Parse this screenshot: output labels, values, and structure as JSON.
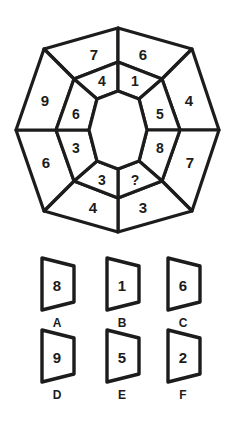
{
  "puzzle": {
    "type": "octagon-ring-number-puzzle",
    "missing_marker": "?",
    "center": {
      "fill": "#ffffff"
    },
    "stroke_color": "#1c1c1c",
    "outer_ring": {
      "label": "outer-ring",
      "count": 8,
      "cells": [
        {
          "pos": "top-left",
          "value": "7"
        },
        {
          "pos": "top-right",
          "value": "6"
        },
        {
          "pos": "right-upper",
          "value": "4"
        },
        {
          "pos": "right-lower",
          "value": "7"
        },
        {
          "pos": "bottom-right",
          "value": "3"
        },
        {
          "pos": "bottom-left",
          "value": "4"
        },
        {
          "pos": "left-lower",
          "value": "6"
        },
        {
          "pos": "left-upper",
          "value": "9"
        }
      ]
    },
    "inner_ring": {
      "label": "inner-ring",
      "count": 8,
      "cells": [
        {
          "pos": "top-left",
          "value": "4"
        },
        {
          "pos": "top-right",
          "value": "1"
        },
        {
          "pos": "right-upper",
          "value": "5"
        },
        {
          "pos": "right-lower",
          "value": "8"
        },
        {
          "pos": "bottom-right",
          "value": "?"
        },
        {
          "pos": "bottom-left",
          "value": "3"
        },
        {
          "pos": "left-lower",
          "value": "3"
        },
        {
          "pos": "left-upper",
          "value": "6"
        }
      ]
    }
  },
  "options": {
    "label": "answer-options",
    "items": [
      {
        "letter": "A",
        "value": "8"
      },
      {
        "letter": "B",
        "value": "1"
      },
      {
        "letter": "C",
        "value": "6"
      },
      {
        "letter": "D",
        "value": "9"
      },
      {
        "letter": "E",
        "value": "5"
      },
      {
        "letter": "F",
        "value": "2"
      }
    ]
  }
}
